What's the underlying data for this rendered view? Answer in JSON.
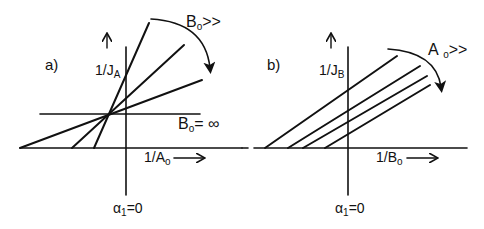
{
  "panels": [
    {
      "id": "a",
      "label": "a)",
      "y_axis_label": "1/J",
      "y_axis_sub": "A",
      "x_axis_label": "1/A",
      "x_axis_sub": "o",
      "bottom_label": "α",
      "bottom_sub": "1",
      "bottom_suffix": "=0",
      "arrow_label": "B",
      "arrow_sub": "o",
      "arrow_suffix": ">>",
      "limit_label": "B",
      "limit_sub": "o",
      "limit_suffix": "= ∞",
      "lines": [
        {
          "x1": 20,
          "y1": 148,
          "x2": 202,
          "y2": 80
        },
        {
          "x1": 72,
          "y1": 148,
          "x2": 184,
          "y2": 45
        },
        {
          "x1": 94,
          "y1": 148,
          "x2": 149,
          "y2": 23
        },
        {
          "x1": 40,
          "y1": 114,
          "x2": 200,
          "y2": 114
        }
      ]
    },
    {
      "id": "b",
      "label": "b)",
      "y_axis_label": "1/J",
      "y_axis_sub": "B",
      "x_axis_label": "1/B",
      "x_axis_sub": "o",
      "bottom_label": "α",
      "bottom_sub": "1",
      "bottom_suffix": "=0",
      "arrow_label": "A",
      "arrow_sub": "o",
      "arrow_suffix": ">>",
      "lines": [
        {
          "x1": 265,
          "y1": 148,
          "x2": 397,
          "y2": 56
        },
        {
          "x1": 288,
          "y1": 148,
          "x2": 420,
          "y2": 66
        },
        {
          "x1": 303,
          "y1": 148,
          "x2": 427,
          "y2": 76
        },
        {
          "x1": 325,
          "y1": 148,
          "x2": 430,
          "y2": 85
        }
      ]
    }
  ],
  "colors": {
    "ink": "#111111",
    "background": "#ffffff"
  }
}
